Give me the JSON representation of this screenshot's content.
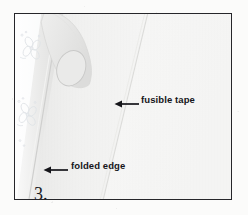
{
  "figure": {
    "kind": "sewing-instruction-illustration",
    "step_number": "3.",
    "frame": {
      "border_color": "#26262a",
      "background_color": "#f7f7f6"
    },
    "page_background_color": "#fbfbfa",
    "text_color": "#15151a"
  },
  "annotations": [
    {
      "id": "fusible-tape",
      "label": "fusible tape",
      "arrow_icon": "left-arrow-icon",
      "arrow_direction": "left"
    },
    {
      "id": "folded-edge",
      "label": "folded edge",
      "arrow_icon": "left-arrow-icon",
      "arrow_direction": "left"
    }
  ],
  "illustration": {
    "elements": [
      {
        "name": "patterned-fabric-strip",
        "description": "floral printed fabric along left edge"
      },
      {
        "name": "flower-motif",
        "count": 2
      },
      {
        "name": "hand-finger",
        "description": "finger pressing fabric fold at top left"
      },
      {
        "name": "fingernail",
        "description": "oval fingernail outline"
      },
      {
        "name": "folded-edge-line",
        "description": "diagonal crease of folded fabric"
      },
      {
        "name": "fusible-tape-edge-line",
        "description": "faint diagonal edge of fusible tape"
      },
      {
        "name": "fabric-panel",
        "description": "large light fabric area on right"
      }
    ],
    "colors": {
      "fabric_light": "#f7f7f6",
      "fabric_shadow": "#e3e3e2",
      "fabric_mid": "#ededec",
      "skin_shade": "#e8e8e7",
      "print_outline": "#dfe2e6"
    }
  }
}
